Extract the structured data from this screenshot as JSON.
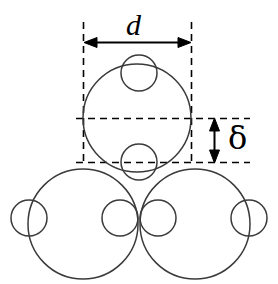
{
  "figure": {
    "type": "geometric-schematic",
    "canvas": {
      "width": 278,
      "height": 284,
      "background": "#ffffff"
    },
    "stroke_color": "#333333",
    "dimension_color": "#000000",
    "labels": {
      "diameter": "d",
      "offset": "δ"
    },
    "annotations": {
      "diameter_label_name": "d",
      "diameter_meaning": "large circle diameter",
      "offset_label_name": "δ",
      "offset_meaning": "vertical offset between centre line and lower tangent line"
    },
    "geometry": {
      "large_circles": [
        {
          "name": "top-large-circle",
          "cx": 137,
          "cy": 118,
          "r": 54
        },
        {
          "name": "bottom-left-large-circle",
          "cx": 83,
          "cy": 224,
          "r": 55
        },
        {
          "name": "bottom-right-large-circle",
          "cx": 195,
          "cy": 224,
          "r": 55
        }
      ],
      "small_circles": [
        {
          "name": "top-group-upper-small-circle",
          "cx": 139,
          "cy": 73,
          "r": 18
        },
        {
          "name": "top-group-lower-small-circle",
          "cx": 139,
          "cy": 162,
          "r": 18
        },
        {
          "name": "bottom-left-outer-small-circle",
          "cx": 29,
          "cy": 218,
          "r": 18
        },
        {
          "name": "bottom-left-inner-small-circle",
          "cx": 120,
          "cy": 218,
          "r": 18
        },
        {
          "name": "bottom-right-inner-small-circle",
          "cx": 158,
          "cy": 218,
          "r": 18
        },
        {
          "name": "bottom-right-outer-small-circle",
          "cx": 249,
          "cy": 218,
          "r": 18
        }
      ],
      "dashed_guides": {
        "box_left_x": 83,
        "box_right_x": 192,
        "box_top_y": 22,
        "box_bottom_y": 162,
        "centre_line_y": 118,
        "guide_extend_right_x": 250
      },
      "dimensions": {
        "d_arrow": {
          "y": 42,
          "x_start": 84,
          "x_end": 191
        },
        "delta_arrow": {
          "x": 214,
          "y_start": 118,
          "y_end": 162
        }
      }
    }
  }
}
